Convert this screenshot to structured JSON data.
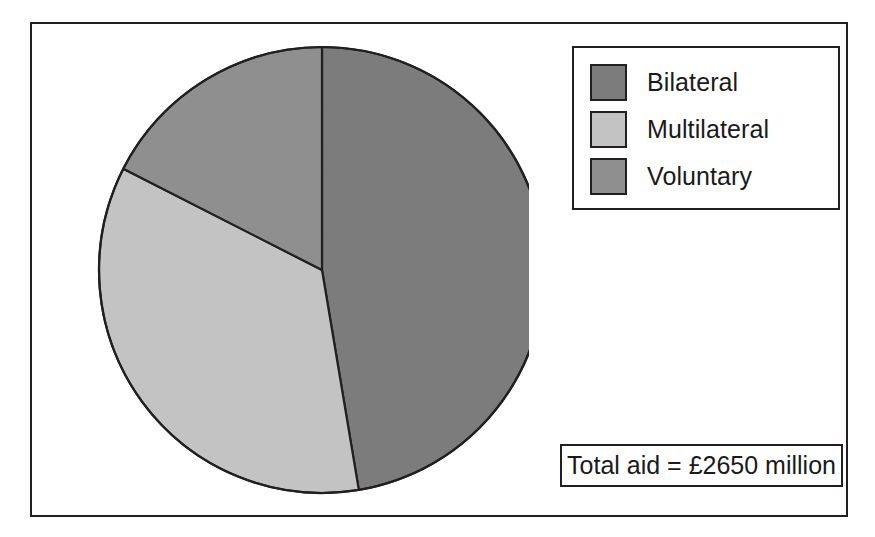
{
  "chart_data": {
    "type": "pie",
    "title": "",
    "subtitle": "",
    "xlabel": "",
    "ylabel": "",
    "grid": false,
    "legend_position": "top-right",
    "categories": [
      "Bilateral",
      "Multilateral",
      "Voluntary"
    ],
    "values": [
      47.4,
      35.1,
      17.5
    ],
    "value_unit": "percent",
    "amounts_million_gbp": [
      1256,
      931,
      463
    ],
    "start_angle_deg": 0,
    "direction": "clockwise",
    "slice_angles_deg": [
      170.5,
      126.5,
      63.0
    ],
    "colors": [
      "#7c7c7c",
      "#c3c3c3",
      "#8f8f8f"
    ],
    "slice_border_color": "#231f20",
    "annotations": [
      "Total aid = £2650 million"
    ],
    "total": 2650
  },
  "legend": {
    "items": [
      {
        "label": "Bilateral",
        "color": "#7c7c7c"
      },
      {
        "label": "Multilateral",
        "color": "#c3c3c3"
      },
      {
        "label": "Voluntary",
        "color": "#8f8f8f"
      }
    ]
  },
  "total_box": {
    "text": "Total aid = £2650 million"
  }
}
